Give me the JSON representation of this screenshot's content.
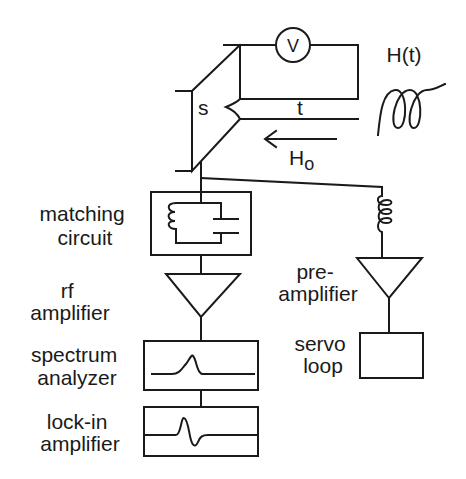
{
  "diagram": {
    "title": "",
    "sample": {
      "label": "s",
      "film_thickness_label": "t",
      "voltmeter_label": "V"
    },
    "fields": {
      "static_field_label": "H",
      "static_field_subscript": "o",
      "modulation_field_label": "H(t)"
    },
    "blocks": {
      "matching_circuit": [
        "matching",
        "circuit"
      ],
      "rf_amplifier": [
        "rf",
        "amplifier"
      ],
      "spectrum_analyzer": [
        "spectrum",
        "analyzer"
      ],
      "lock_in_amplifier": [
        "lock-in",
        "amplifier"
      ],
      "pre_amplifier": [
        "pre-",
        "amplifier"
      ],
      "servo_loop": [
        "servo",
        "loop"
      ]
    },
    "colors": {
      "ink": "#1a1a1a",
      "background": "#ffffff"
    }
  }
}
